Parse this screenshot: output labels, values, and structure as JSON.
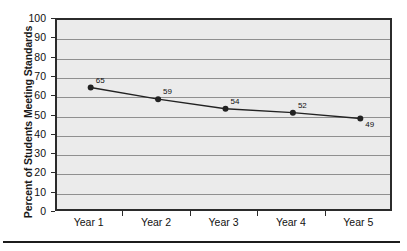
{
  "figure": {
    "background_color": "#ffffff",
    "plot_background_color": "#ebebeb",
    "plot_border_color": "#2b2b2b",
    "gridline_color": "#8f8f8f",
    "series_color": "#222222",
    "bottom_rule_color": "#1c1c1c"
  },
  "chart_data": {
    "type": "line",
    "title": "",
    "xlabel": "",
    "ylabel": "Percent of Students Meeting Standards",
    "categories": [
      "Year 1",
      "Year 2",
      "Year 3",
      "Year 4",
      "Year 5"
    ],
    "values": [
      65,
      59,
      54,
      52,
      49
    ],
    "point_labels": [
      "65",
      "59",
      "54",
      "52",
      "49"
    ],
    "ylim": [
      0,
      100
    ],
    "ytick_step": 10,
    "ytick_labels": [
      "100",
      "90",
      "80",
      "70",
      "60",
      "50",
      "40",
      "30",
      "20",
      "10",
      "0"
    ],
    "ytick_values": [
      100,
      90,
      80,
      70,
      60,
      50,
      40,
      30,
      20,
      10,
      0
    ],
    "grid": "horizontal",
    "legend": "none",
    "marker": "circle",
    "series": [
      {
        "name": "Percent of Students Meeting Standards",
        "values": [
          65,
          59,
          54,
          52,
          49
        ]
      }
    ]
  }
}
